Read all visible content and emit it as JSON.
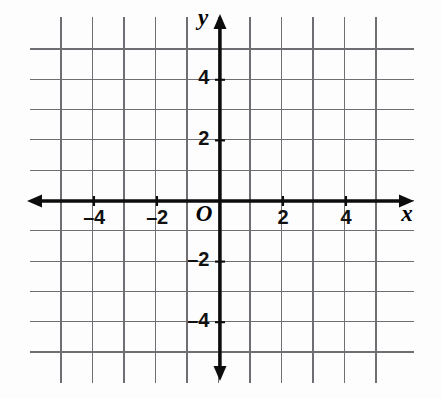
{
  "figure": {
    "kind": "coordinate-plane",
    "width": 442,
    "height": 398,
    "background_color": "#fdfdfd",
    "grid_color": "#6f6f73",
    "axis_color": "#0d0d0d",
    "label_color": "#111111"
  },
  "chart_data": {
    "type": "scatter",
    "title": "",
    "subtitle": "",
    "xlabel": "x",
    "ylabel": "y",
    "origin_label": "O",
    "xlim": [
      -5,
      5
    ],
    "ylim": [
      -5,
      5
    ],
    "grid": true,
    "grid_step": 1,
    "tick_step": 2,
    "legend": null,
    "x_tick_values": [
      -4,
      -2,
      2,
      4
    ],
    "x_tick_labels": [
      "–4",
      "–2",
      "2",
      "4"
    ],
    "y_tick_values": [
      4,
      2,
      -2,
      -4
    ],
    "y_tick_labels": [
      "4",
      "2",
      "–2",
      "–4"
    ],
    "series": [],
    "x": [],
    "values": [],
    "annotations": []
  },
  "axes": {
    "x_axis_name": "x",
    "y_axis_name": "y",
    "origin": "O",
    "x_ticks": [
      {
        "value": -4,
        "label": "–4",
        "px": 94,
        "py": 219
      },
      {
        "value": -2,
        "label": "–2",
        "px": 157,
        "py": 219
      },
      {
        "value": 2,
        "label": "2",
        "px": 283,
        "py": 219
      },
      {
        "value": 4,
        "label": "4",
        "px": 346,
        "py": 219
      }
    ],
    "y_ticks": [
      {
        "value": 4,
        "label": "4",
        "px": 209,
        "py": 79
      },
      {
        "value": 2,
        "label": "2",
        "px": 209,
        "py": 140
      },
      {
        "value": -2,
        "label": "–2",
        "px": 209,
        "py": 261
      },
      {
        "value": -4,
        "label": "–4",
        "px": 209,
        "py": 322
      }
    ],
    "x_axis_label_pos": {
      "px": 407,
      "py": 216
    },
    "y_axis_label_pos": {
      "px": 203,
      "py": 20
    },
    "origin_label_pos": {
      "px": 204,
      "py": 216
    }
  },
  "geometry": {
    "origin_px": {
      "x": 220,
      "y": 201
    },
    "unit_px_x": 31.5,
    "unit_px_y": 30.3,
    "grid_vertical_x": [
      61,
      92.5,
      124,
      155.5,
      187,
      218.5,
      250,
      281.5,
      313,
      344.5,
      376
    ],
    "grid_horizontal_y": [
      49,
      79.3,
      109.6,
      139.9,
      170.2,
      200.5,
      230.8,
      261.1,
      291.4,
      321.7,
      352
    ],
    "grid_vertical_top": 17,
    "grid_vertical_bottom": 383,
    "grid_horizontal_left": 30,
    "grid_horizontal_right": 414,
    "x_axis_left_tip": 27,
    "x_axis_right_tip": 414,
    "y_axis_top_tip": 14,
    "y_axis_bottom_tip": 381
  }
}
